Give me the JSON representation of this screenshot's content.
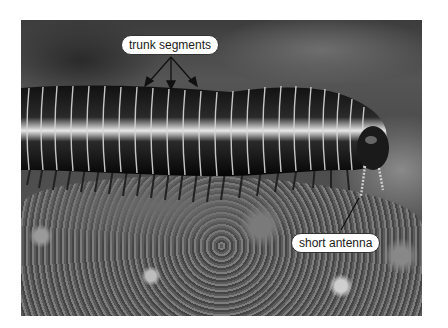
{
  "figure": {
    "labels": [
      {
        "id": "trunk",
        "text": "trunk segments",
        "arrows": 3
      },
      {
        "id": "antenna",
        "text": "short antenna",
        "arrows": 1
      }
    ],
    "colors": {
      "callout_fill": "#ffffff",
      "callout_border": "#333333",
      "arrow": "#111111"
    }
  }
}
